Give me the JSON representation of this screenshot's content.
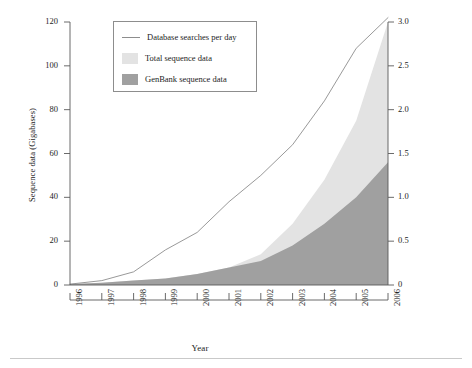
{
  "chart_data": {
    "type": "area",
    "title": "",
    "xlabel": "Year",
    "ylabel": "Sequence data (Gigabases)",
    "ylabel_right": "Database searches per day (millions)",
    "categories": [
      "1996",
      "1997",
      "1998",
      "1999",
      "2000",
      "2001",
      "2002",
      "2003",
      "2004",
      "2005",
      "2006"
    ],
    "x": [
      1996,
      1997,
      1998,
      1999,
      2000,
      2001,
      2002,
      2003,
      2004,
      2005,
      2006
    ],
    "ylim": [
      0,
      120
    ],
    "ylim_right": [
      0,
      3.0
    ],
    "yticks": [
      0,
      20,
      40,
      60,
      80,
      100,
      120
    ],
    "yticks_right": [
      "0",
      "0.5",
      "1.0",
      "1.5",
      "2.0",
      "2.5",
      "3.0"
    ],
    "ytick_values_right": [
      0,
      0.5,
      1.0,
      1.5,
      2.0,
      2.5,
      3.0
    ],
    "grid": false,
    "legend_position": "top-left-inside",
    "series": [
      {
        "name": "Database searches per day",
        "type": "line",
        "axis": "right",
        "color": "#8d8d8d",
        "values": [
          0.01,
          0.05,
          0.15,
          0.4,
          0.6,
          0.95,
          1.25,
          1.6,
          2.1,
          2.7,
          3.05
        ]
      },
      {
        "name": "Total sequence data",
        "type": "area",
        "axis": "left",
        "color": "#e3e3e3",
        "values": [
          0.5,
          1,
          2,
          3,
          5,
          8,
          14,
          28,
          48,
          75,
          120
        ]
      },
      {
        "name": "GenBank sequence data",
        "type": "area",
        "axis": "left",
        "color": "#a0a0a0",
        "values": [
          0.5,
          1,
          2,
          3,
          5,
          8,
          11,
          18,
          28,
          40,
          56
        ]
      }
    ]
  },
  "legend": {
    "items": [
      {
        "label": "Database searches per day",
        "marker": "line",
        "color": "#8d8d8d"
      },
      {
        "label": "Total sequence data",
        "marker": "swatch",
        "color": "#e3e3e3"
      },
      {
        "label": "GenBank sequence data",
        "marker": "swatch",
        "color": "#a0a0a0"
      }
    ]
  },
  "colors": {
    "axis": "#5a5a5a",
    "line": "#8d8d8d",
    "total_area": "#e3e3e3",
    "genbank_area": "#a0a0a0",
    "text": "#1d1d1d",
    "rule": "#c9c9c9"
  }
}
